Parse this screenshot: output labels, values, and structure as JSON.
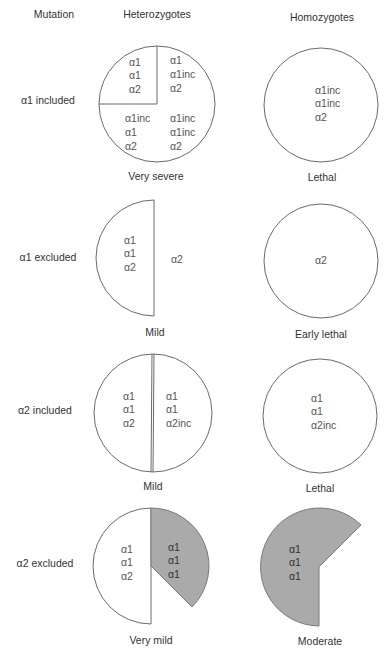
{
  "headers": {
    "mutation": "Mutation",
    "heterozygotes": "Heterozygotes",
    "homozygotes": "Homozygotes"
  },
  "colors": {
    "outline": "#6a6a6a",
    "shaded": "#aaaaaa",
    "text": "#333333"
  },
  "rows": [
    {
      "label": "α1 included",
      "heterozygote": {
        "shape": "full circle divided: one quarter (upper-left) + three quarter regions",
        "sectors": [
          {
            "position": "upper-left",
            "lines": [
              "α1",
              "α1",
              "α2"
            ]
          },
          {
            "position": "upper-right",
            "lines": [
              "α1",
              "α1inc",
              "α2"
            ]
          },
          {
            "position": "lower-left",
            "lines": [
              "α1inc",
              "α1",
              "α2"
            ]
          },
          {
            "position": "lower-right",
            "lines": [
              "α1inc",
              "α1inc",
              "α2"
            ]
          }
        ],
        "phenotype": "Very severe"
      },
      "homozygote": {
        "shape": "full circle",
        "lines": [
          "α1inc",
          "α1inc",
          "α2"
        ],
        "phenotype": "Lethal"
      }
    },
    {
      "label": "α1 excluded",
      "heterozygote": {
        "shape": "left half circle",
        "lines": [
          "α1",
          "α1",
          "α2"
        ],
        "outside_label": "α2",
        "phenotype": "Mild"
      },
      "homozygote": {
        "shape": "full circle",
        "lines": [
          "α2"
        ],
        "phenotype": "Early lethal"
      }
    },
    {
      "label": "α2 included",
      "heterozygote": {
        "shape": "circle split into halves",
        "left_lines": [
          "α1",
          "α1",
          "α2"
        ],
        "right_lines": [
          "α1",
          "α1",
          "α2inc"
        ],
        "phenotype": "Mild"
      },
      "homozygote": {
        "shape": "full circle",
        "lines": [
          "α1",
          "α1",
          "α2inc"
        ],
        "phenotype": "Lethal"
      }
    },
    {
      "label": "α2 excluded",
      "heterozygote": {
        "shape": "left half white + shaded wedge on right",
        "left_lines": [
          "α1",
          "α1",
          "α2"
        ],
        "shaded_lines": [
          "α1",
          "α1",
          "α1"
        ],
        "phenotype": "Very mild"
      },
      "homozygote": {
        "shape": "shaded 225-degree sector",
        "lines": [
          "α1",
          "α1",
          "α1"
        ],
        "phenotype": "Moderate"
      }
    }
  ]
}
